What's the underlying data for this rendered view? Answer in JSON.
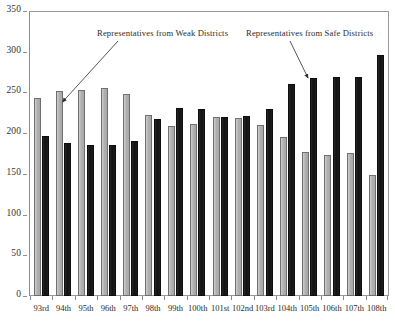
{
  "chart_data": {
    "type": "bar",
    "title": "",
    "xlabel": "",
    "ylabel": "",
    "ylim": [
      0,
      350
    ],
    "yticks": [
      0,
      50,
      100,
      150,
      200,
      250,
      300,
      350
    ],
    "grid": false,
    "legend_position": "annotations-inside-plot",
    "categories": [
      "93rd",
      "94th",
      "95th",
      "96th",
      "97th",
      "98th",
      "99th",
      "100th",
      "101st",
      "102nd",
      "103rd",
      "104th",
      "105th",
      "106th",
      "107th",
      "108th"
    ],
    "series": [
      {
        "name": "Representatives from Weak Districts",
        "color": "#b6b6b6",
        "values": [
          244,
          253,
          254,
          256,
          249,
          223,
          209,
          212,
          221,
          220,
          211,
          196,
          177,
          174,
          176,
          149
        ]
      },
      {
        "name": "Representatives from Safe Districts",
        "color": "#171717",
        "values": [
          197,
          188,
          186,
          186,
          191,
          218,
          232,
          230,
          221,
          222,
          231,
          261,
          269,
          270,
          270,
          297
        ]
      }
    ],
    "annotations": [
      {
        "id": "weak-annotation",
        "text": "Representatives from Weak Districts",
        "points_to": "94th weak bar"
      },
      {
        "id": "safe-annotation",
        "text": "Representatives from Safe Districts",
        "points_to": "105th safe bar"
      }
    ]
  },
  "axis": {
    "y_tick_labels": [
      "0",
      "50",
      "100",
      "150",
      "200",
      "250",
      "300",
      "350"
    ],
    "x_tick_labels": [
      "93rd",
      "94th",
      "95th",
      "96th",
      "97th",
      "98th",
      "99th",
      "100th",
      "101st",
      "102nd",
      "103rd",
      "104th",
      "105th",
      "106th",
      "107th",
      "108th"
    ]
  }
}
